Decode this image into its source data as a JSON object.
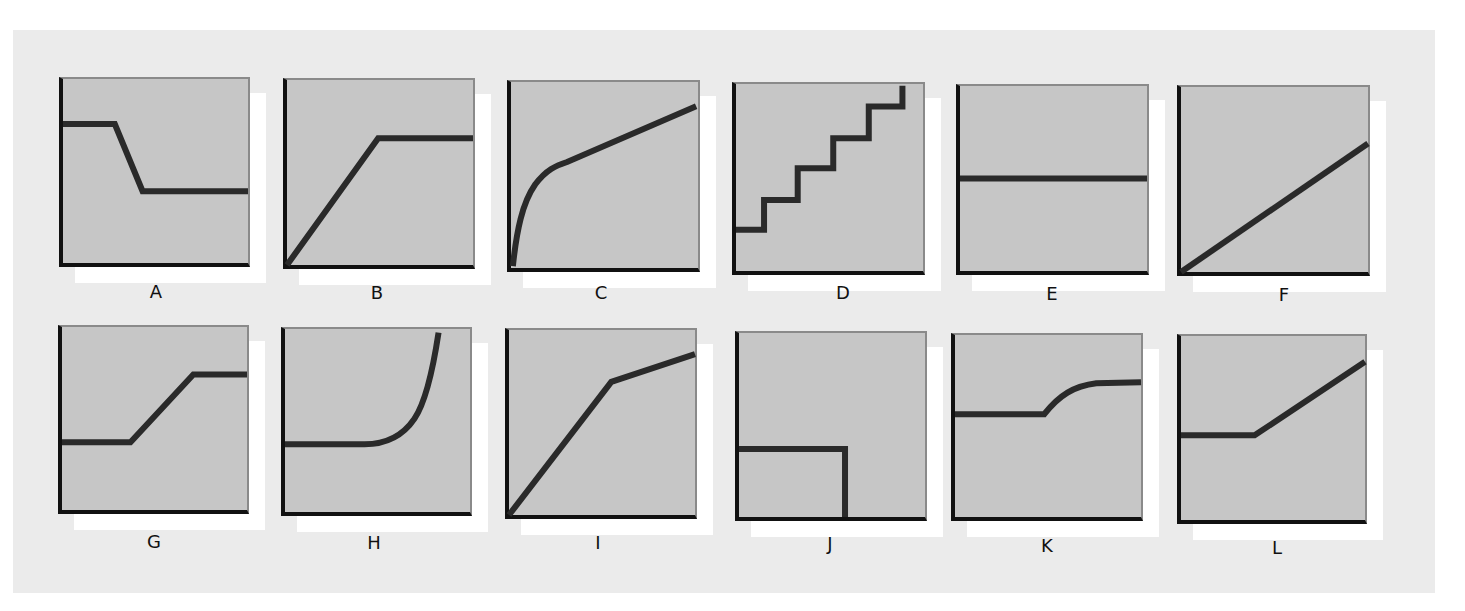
{
  "colors": {
    "panel": "#ebebeb",
    "plot_fill": "#c6c6c6",
    "plot_border": "#8a8a8a",
    "axis": "#111111",
    "curve": "#2a2a2a",
    "shadow": "#ffffff"
  },
  "chart_data": [
    {
      "label": "A",
      "type": "line",
      "shape": "high plateau, drop, low plateau",
      "box": [
        59,
        77,
        191,
        190
      ],
      "label_pos": [
        156,
        292
      ],
      "path": "M0,24.5 L28,24.5 L43,61 L100,61"
    },
    {
      "label": "B",
      "type": "line",
      "shape": "linear rise then plateau",
      "box": [
        283,
        78,
        192,
        191
      ],
      "label_pos": [
        377,
        293
      ],
      "path": "M0,100 L49,31.5 L100,31.5"
    },
    {
      "label": "C",
      "type": "line",
      "shape": "steep concave rise then gentle linear rise",
      "box": [
        507,
        80,
        193,
        192
      ],
      "label_pos": [
        601,
        293
      ],
      "path": "M1,99 C3,80 6,65 13,55 C19,47 24,45 30,43 L99,13"
    },
    {
      "label": "D",
      "type": "line",
      "shape": "staircase",
      "box": [
        732,
        82,
        193,
        193
      ],
      "label_pos": [
        843,
        293
      ],
      "path": "M0,78 L15,78 L15,62 L33,62 L33,45 L52,45 L52,29 L71,29 L71,12 L89,12 L89,1"
    },
    {
      "label": "E",
      "type": "line",
      "shape": "horizontal constant",
      "box": [
        956,
        84,
        193,
        191
      ],
      "label_pos": [
        1052,
        294
      ],
      "path": "M0,50 L100,50"
    },
    {
      "label": "F",
      "type": "line",
      "shape": "straight linear rise",
      "box": [
        1177,
        85,
        193,
        191
      ],
      "label_pos": [
        1284,
        295
      ],
      "path": "M0,100 L100,30.5"
    },
    {
      "label": "G",
      "type": "line",
      "shape": "low plateau, rise, high plateau",
      "box": [
        58,
        325,
        191,
        189
      ],
      "label_pos": [
        154,
        542
      ],
      "path": "M0,63 L37,63 L71,26 L100,26"
    },
    {
      "label": "H",
      "type": "line",
      "shape": "flat then exponential rise",
      "box": [
        281,
        327,
        191,
        189
      ],
      "label_pos": [
        374,
        543
      ],
      "path": "M0,63 L43,63 C55,63 64,58 70,49 C76,40 80,22 83,2"
    },
    {
      "label": "I",
      "type": "line",
      "shape": "steep linear rise then shallower linear rise",
      "box": [
        505,
        328,
        192,
        191
      ],
      "label_pos": [
        598,
        543
      ],
      "path": "M0,100 L55,28 L100,13"
    },
    {
      "label": "J",
      "type": "line",
      "shape": "plateau then vertical drop",
      "box": [
        735,
        331,
        192,
        190
      ],
      "label_pos": [
        830,
        544
      ],
      "path": "M0,63 L57,63 L57,100"
    },
    {
      "label": "K",
      "type": "line",
      "shape": "plateau then smooth saturating rise",
      "box": [
        951,
        333,
        192,
        188
      ],
      "label_pos": [
        1047,
        546
      ],
      "path": "M0,43.5 L48,43.5 C56,33 64,28 76,26.5 L100,26"
    },
    {
      "label": "L",
      "type": "line",
      "shape": "plateau then linear rise",
      "box": [
        1177,
        334,
        190,
        190
      ],
      "label_pos": [
        1277,
        548
      ],
      "path": "M0,54 L40,54 L100,14"
    }
  ]
}
